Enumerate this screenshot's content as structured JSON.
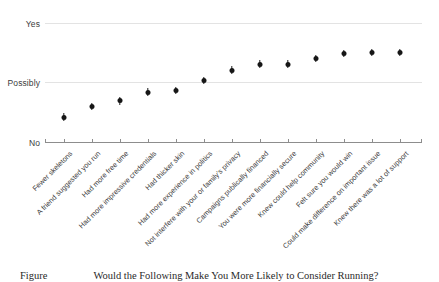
{
  "chart_data": {
    "type": "scatter",
    "title": "Would the Following Make You More Likely to Consider Running?",
    "xlabel": "",
    "ylabel": "",
    "grid": true,
    "legend": null,
    "ylim": [
      0,
      2
    ],
    "ytick_labels": [
      "No",
      "Possibly",
      "Yes"
    ],
    "ytick_values": [
      0,
      1,
      2
    ],
    "categories": [
      "Fewer skeletons",
      "A friend suggested you run",
      "Had more free time",
      "Had more impressive credentials",
      "Had thicker skin",
      "Had more experience in politics",
      "Not interfere with your or family's privacy",
      "Campaigns publically financed",
      "You were more financially secure",
      "Knew could help community",
      "Felt sure you would win",
      "Could make difference on important issue",
      "Knew there was a lot of support"
    ],
    "values": [
      0.42,
      0.59,
      0.69,
      0.84,
      0.86,
      1.04,
      1.21,
      1.31,
      1.31,
      1.41,
      1.48,
      1.51,
      1.51
    ],
    "error_low": [
      0.36,
      0.53,
      0.63,
      0.78,
      0.8,
      0.98,
      1.15,
      1.25,
      1.25,
      1.35,
      1.42,
      1.45,
      1.45
    ],
    "error_high": [
      0.48,
      0.65,
      0.75,
      0.9,
      0.92,
      1.1,
      1.27,
      1.37,
      1.37,
      1.47,
      1.54,
      1.57,
      1.57
    ]
  },
  "caption": {
    "prefix": "Figure",
    "text": "Would the Following Make You More Likely to Consider Running?"
  },
  "colors": {
    "marker": "#161616",
    "grid": "#e3e3e3",
    "axis": "#8d8d8d",
    "text": "#3c3c3c",
    "background": "#ffffff"
  }
}
